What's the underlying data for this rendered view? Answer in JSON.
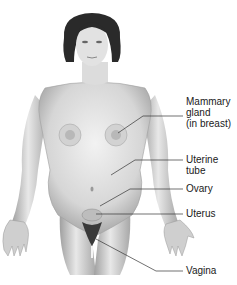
{
  "figure": {
    "labels": [
      {
        "id": "mammary",
        "lines": [
          "Mammary",
          "gland",
          "(in breast)"
        ],
        "top": 96
      },
      {
        "id": "uterine_tube",
        "lines": [
          "Uterine",
          "tube"
        ],
        "top": 156
      },
      {
        "id": "ovary",
        "lines": [
          "Ovary"
        ],
        "top": 183
      },
      {
        "id": "uterus",
        "lines": [
          "Uterus"
        ],
        "top": 207
      },
      {
        "id": "vagina",
        "lines": [
          "Vagina"
        ],
        "top": 263
      }
    ]
  },
  "colors": {
    "skin_light": "#e6e6e6",
    "skin_shadow": "#9a9a9a",
    "hair": "#2a2a2a",
    "leader": "#333333",
    "text": "#1a1a1a"
  }
}
